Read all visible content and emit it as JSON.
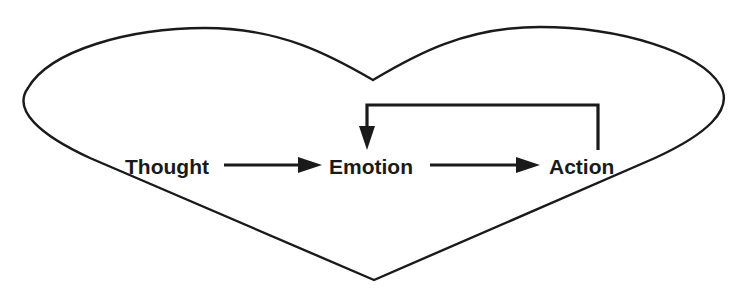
{
  "diagram": {
    "shape": "heart",
    "stroke_color": "#1a1a1a",
    "background": "#ffffff",
    "nodes": [
      {
        "id": "thought",
        "label": "Thought"
      },
      {
        "id": "emotion",
        "label": "Emotion"
      },
      {
        "id": "action",
        "label": "Action"
      }
    ],
    "edges": [
      {
        "from": "thought",
        "to": "emotion",
        "type": "straight-arrow"
      },
      {
        "from": "emotion",
        "to": "action",
        "type": "straight-arrow"
      },
      {
        "from": "action",
        "to": "emotion",
        "type": "feedback-loop-arrow"
      }
    ]
  }
}
